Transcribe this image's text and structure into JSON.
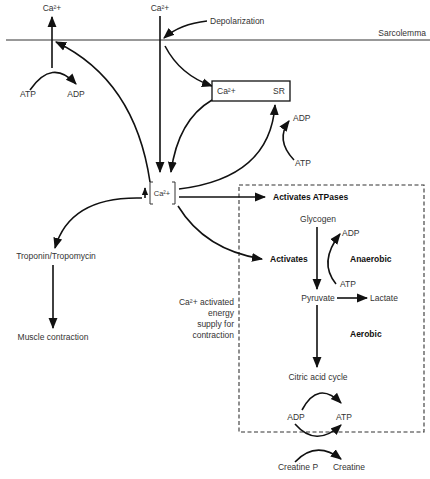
{
  "diagram": {
    "membrane_label": "Sarcolemma",
    "labels": {
      "ca_out_left": "Ca²+",
      "ca_out_center": "Ca²+",
      "depolarization": "Depolarization",
      "atp_pump": "ATP",
      "adp_pump": "ADP",
      "sr_ca": "Ca²+",
      "sr": "SR",
      "sr_adp": "ADP",
      "sr_atp": "ATP",
      "cytosolic_ca": "Ca²+",
      "troponin": "Troponin/Tropomycin",
      "muscle_contraction": "Muscle contraction",
      "energy_note": [
        "Ca²+ activated",
        "energy",
        "supply for",
        "contraction"
      ],
      "activates_atpases": "Activates ATPases",
      "glycogen": "Glycogen",
      "activates": "Activates",
      "anaerobic_adp": "ADP",
      "anaerobic": "Anaerobic",
      "anaerobic_atp": "ATP",
      "pyruvate": "Pyruvate",
      "lactate": "Lactate",
      "aerobic": "Aerobic",
      "citric_acid_cycle": "Citric acid cycle",
      "cycle_adp": "ADP",
      "cycle_atp": "ATP",
      "creatine_p": "Creatine P",
      "creatine": "Creatine"
    }
  }
}
